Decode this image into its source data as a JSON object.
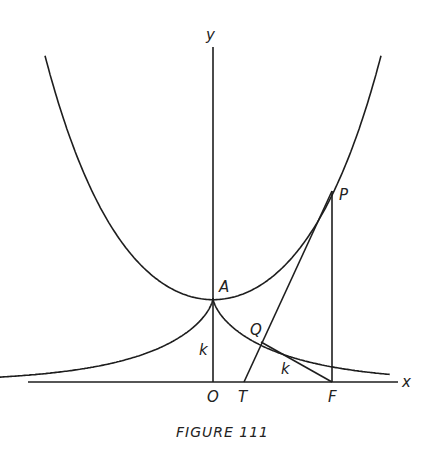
{
  "figure": {
    "caption": "FIGURE 111",
    "axes": {
      "x_label": "x",
      "y_label": "y"
    },
    "points": {
      "O": "O",
      "A": "A",
      "P": "P",
      "Q": "Q",
      "T": "T",
      "F": "F"
    },
    "segment_labels": {
      "OA": "k",
      "QF": "k"
    },
    "curves": [
      "catenary",
      "tractrix-left",
      "tractrix-right"
    ],
    "lines": [
      "tangent-TP",
      "segment-PF",
      "segment-QF",
      "segment-OA"
    ]
  }
}
